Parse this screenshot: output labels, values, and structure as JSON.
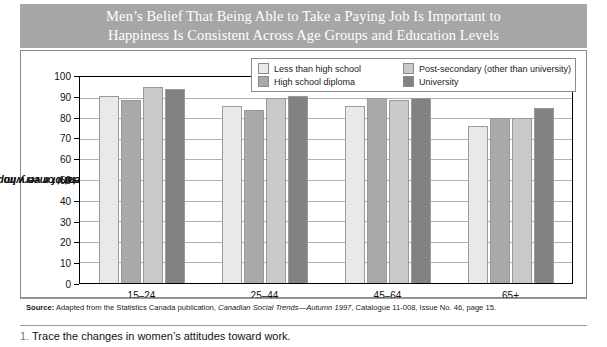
{
  "title": {
    "line1": "Men’s Belief That Being Able to Take a Paying Job Is Important to",
    "line2": "Happiness Is Consistent Across Age Groups and Education Levels",
    "banner_color": "#a6a6a6"
  },
  "legend": {
    "items": [
      {
        "label": "Less than high school",
        "color": "#e9e9e9"
      },
      {
        "label": "High school diploma",
        "color": "#a9a9a9"
      },
      {
        "label": "Post-secondary (other than university)",
        "color": "#c9c9c9"
      },
      {
        "label": "University",
        "color": "#828282"
      }
    ]
  },
  "source": {
    "label": "Source:",
    "text_before": " Adapted from the Statistics Canada publication, ",
    "italic": "Canadian Social Trends—Autumn 1997",
    "text_after": ", Catalogue 11-008, Issue No. 46, page 15."
  },
  "question": {
    "number": "1.",
    "text": "Trace the changes in women’s attitudes toward work."
  },
  "chart_data": {
    "type": "bar",
    "title": "Men’s Belief That Being Able to Take a Paying Job Is Important to Happiness Is Consistent Across Age Groups and Education Levels",
    "xlabel": "",
    "ylabel": "Percent of men who stated important or very important",
    "ylabel_line1": "Percent of men who stated",
    "ylabel_line2": "important or very important",
    "categories": [
      "15–24",
      "25–44",
      "45–64",
      "65+"
    ],
    "ylim": [
      0,
      100
    ],
    "yticks": [
      0,
      10,
      20,
      30,
      40,
      50,
      60,
      70,
      80,
      90,
      100
    ],
    "grid": true,
    "legend_position": "top-right",
    "series": [
      {
        "name": "Less than high school",
        "color": "#e9e9e9",
        "values": [
          91,
          86,
          86,
          76
        ]
      },
      {
        "name": "High school diploma",
        "color": "#a9a9a9",
        "values": [
          89,
          84,
          90,
          80
        ]
      },
      {
        "name": "Post-secondary (other than university)",
        "color": "#c9c9c9",
        "values": [
          95,
          90,
          89,
          80
        ]
      },
      {
        "name": "University",
        "color": "#828282",
        "values": [
          94,
          91,
          90,
          85
        ]
      }
    ]
  }
}
